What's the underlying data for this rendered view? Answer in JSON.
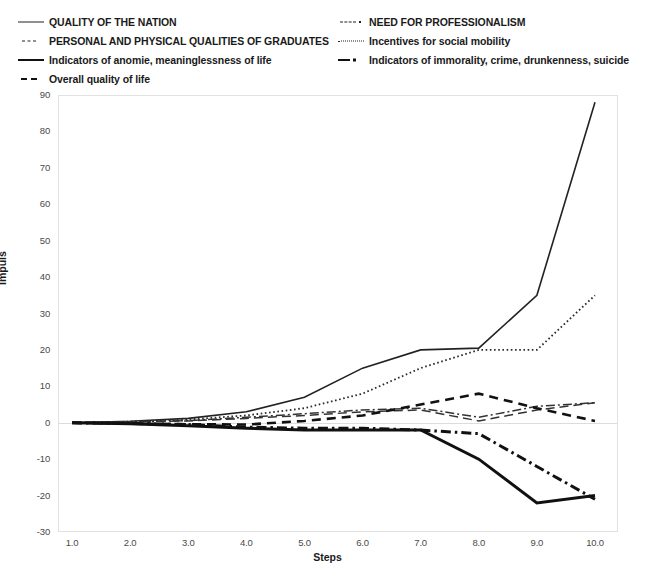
{
  "chart_data": {
    "type": "line",
    "title": "",
    "xlabel": "Steps",
    "ylabel": "Impuls",
    "x": [
      1.0,
      2.0,
      3.0,
      4.0,
      5.0,
      6.0,
      7.0,
      8.0,
      9.0,
      10.0
    ],
    "xticklabels": [
      "1.0",
      "2.0",
      "3.0",
      "4.0",
      "5.0",
      "6.0",
      "7.0",
      "8.0",
      "9.0",
      "10.0"
    ],
    "yticklabels": [
      "90",
      "80",
      "70",
      "60",
      "50",
      "40",
      "30",
      "20",
      "10",
      "0",
      "-10",
      "-20",
      "-30"
    ],
    "yticks": [
      90,
      80,
      70,
      60,
      50,
      40,
      30,
      20,
      10,
      0,
      -10,
      -20,
      -30
    ],
    "xlim": [
      1.0,
      10.0
    ],
    "ylim": [
      -30,
      90
    ],
    "grid": false,
    "legend_position": "top",
    "series": [
      {
        "name": "QUALITY OF THE NATION",
        "style": "solid-thin",
        "color": "#222222",
        "width": 1.6,
        "values": [
          0,
          0.4,
          1.2,
          3,
          7,
          15,
          20,
          20.5,
          35,
          88
        ]
      },
      {
        "name": "NEED FOR PROFESSIONALISM",
        "style": "dash-dot-thin",
        "color": "#333333",
        "width": 1.5,
        "values": [
          0,
          0.2,
          0.6,
          1.5,
          2.5,
          3.5,
          4,
          1.5,
          4.5,
          5.5
        ]
      },
      {
        "name": "PERSONAL AND PHYSICAL QUALITIES OF GRADUATES",
        "style": "dash-long",
        "color": "#333333",
        "width": 1.5,
        "values": [
          0,
          0.2,
          0.5,
          1.2,
          2,
          3,
          3.5,
          0.5,
          3.5,
          5.5
        ]
      },
      {
        "name": "Incentives for social mobility",
        "style": "dotted",
        "color": "#2a2a2a",
        "width": 1.8,
        "values": [
          0,
          0.3,
          0.9,
          2,
          4,
          8,
          15,
          20,
          20,
          35
        ]
      },
      {
        "name": "Indicators of anomie, meaninglessness of life",
        "style": "solid-thick",
        "color": "#111111",
        "width": 3.0,
        "values": [
          0,
          -0.3,
          -0.8,
          -1.5,
          -2,
          -2,
          -2,
          -10,
          -22,
          -20
        ]
      },
      {
        "name": "Indicators of immorality, crime, drunkenness, suicide",
        "style": "thick-dash-dot",
        "color": "#111111",
        "width": 3.0,
        "values": [
          0,
          -0.2,
          -0.5,
          -1.2,
          -1.5,
          -1.5,
          -2,
          -3,
          -12,
          -21
        ]
      },
      {
        "name": "Overall quality of life",
        "style": "dash-med-thick",
        "color": "#111111",
        "width": 2.6,
        "values": [
          0,
          -0.2,
          -0.4,
          -0.5,
          0.5,
          2,
          5,
          8,
          4,
          0.5
        ]
      }
    ]
  },
  "legend": {
    "left_column": [
      {
        "label": "QUALITY OF THE NATION",
        "swatch": "solid-thin"
      },
      {
        "label": "PERSONAL AND PHYSICAL QUALITIES OF GRADUATES",
        "swatch": "dash-long"
      },
      {
        "label": "Indicators of anomie, meaninglessness of life",
        "swatch": "solid-thick"
      },
      {
        "label": "Overall quality of life",
        "swatch": "dash-med-thick"
      }
    ],
    "right_column": [
      {
        "label": "NEED FOR PROFESSIONALISM",
        "swatch": "dash-dot-thin"
      },
      {
        "label": "Incentives for social mobility",
        "swatch": "dotted"
      },
      {
        "label": "Indicators of immorality, crime, drunkenness, suicide",
        "swatch": "thick-dash-dot"
      }
    ]
  },
  "axes": {
    "x_title": "Steps",
    "y_title": "Impuls"
  }
}
